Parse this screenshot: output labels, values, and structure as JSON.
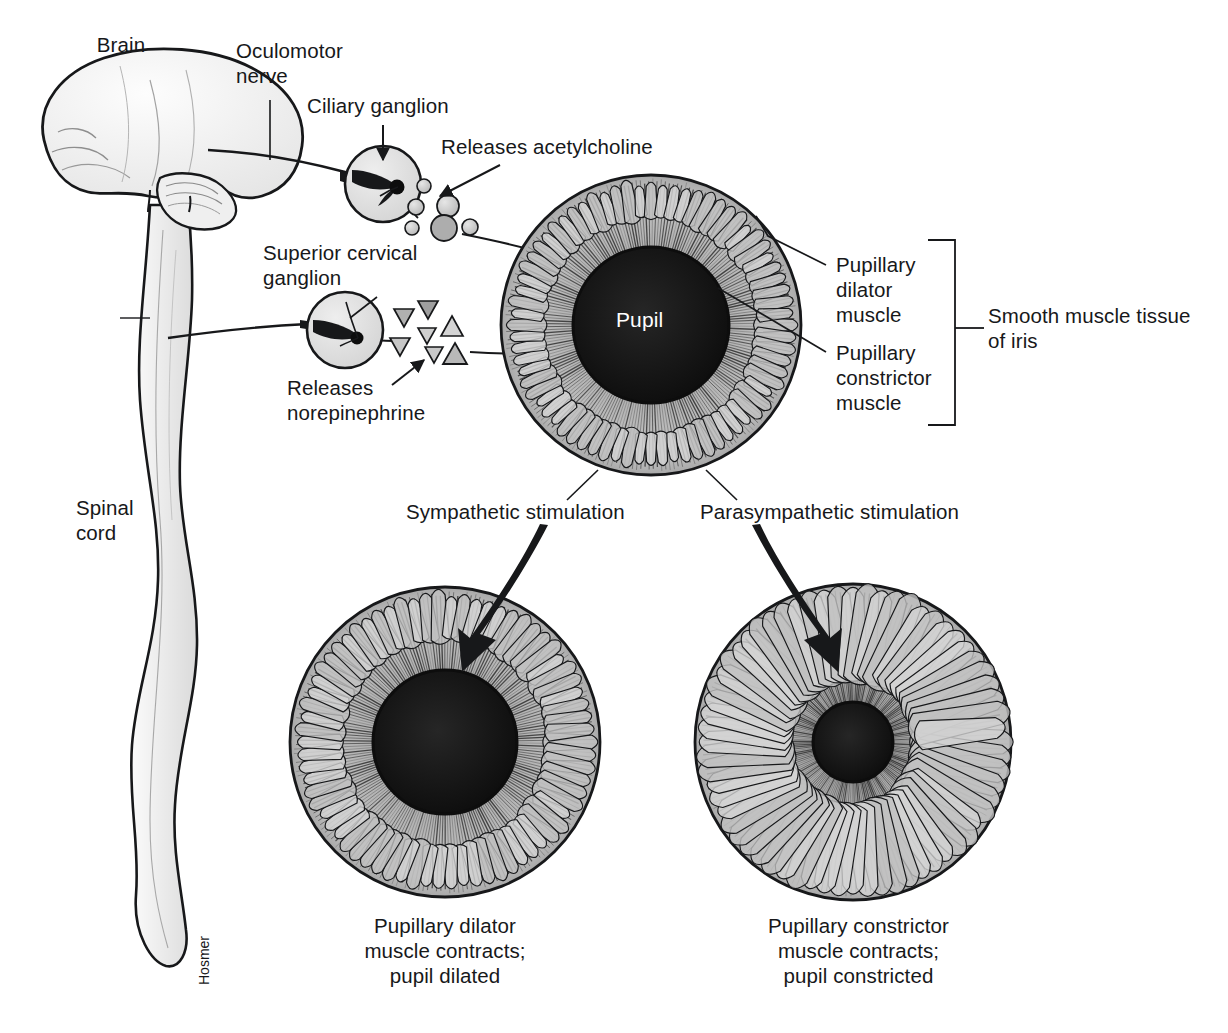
{
  "figure": {
    "artist_signature": "Hosmer",
    "background_color": "#ffffff",
    "ink_color": "#17181a",
    "tissue_fill": "#e9e9e9",
    "iris_fill": "#b9b9b9",
    "pupil_fill": "#141414"
  },
  "labels": {
    "brain": "Brain",
    "oculomotor_nerve": "Oculomotor\nnerve",
    "ciliary_ganglion": "Ciliary ganglion",
    "releases_acetylcholine": "Releases acetylcholine",
    "superior_cervical_ganglion": "Superior cervical\nganglion",
    "releases_norepinephrine": "Releases\nnorepinephrine",
    "spinal_cord": "Spinal\ncord",
    "pupil": "Pupil",
    "pupillary_dilator_muscle": "Pupillary\ndilator\nmuscle",
    "pupillary_constrictor_muscle": "Pupillary\nconstrictor\nmuscle",
    "smooth_muscle_tissue_of_iris": "Smooth muscle tissue\nof iris",
    "sympathetic_stimulation": "Sympathetic stimulation",
    "parasympathetic_stimulation": "Parasympathetic stimulation",
    "dilated_caption": "Pupillary dilator\nmuscle contracts;\npupil dilated",
    "constricted_caption": "Pupillary constrictor\nmuscle contracts;\npupil constricted"
  },
  "anatomy": {
    "ganglia": [
      {
        "name": "ciliary-ganglion",
        "cx": 383,
        "cy": 184,
        "r": 38
      },
      {
        "name": "superior-cervical-ganglion",
        "cx": 345,
        "cy": 330,
        "r": 38
      }
    ],
    "neurotransmitters": {
      "acetylcholine": {
        "shape": "circle",
        "particles": [
          {
            "cx": 424,
            "cy": 186,
            "r": 7
          },
          {
            "cx": 416,
            "cy": 207,
            "r": 8
          },
          {
            "cx": 412,
            "cy": 228,
            "r": 7
          },
          {
            "cx": 448,
            "cy": 206,
            "r": 11
          },
          {
            "cx": 444,
            "cy": 228,
            "r": 13
          },
          {
            "cx": 470,
            "cy": 227,
            "r": 8
          }
        ]
      },
      "norepinephrine": {
        "shape": "triangle",
        "particles": [
          {
            "cx": 404,
            "cy": 318,
            "r": 10,
            "dir": "down"
          },
          {
            "cx": 400,
            "cy": 347,
            "r": 10,
            "dir": "down"
          },
          {
            "cx": 428,
            "cy": 310,
            "r": 10,
            "dir": "down"
          },
          {
            "cx": 427,
            "cy": 336,
            "r": 9,
            "dir": "down"
          },
          {
            "cx": 434,
            "cy": 355,
            "r": 9,
            "dir": "down"
          },
          {
            "cx": 452,
            "cy": 327,
            "r": 11,
            "dir": "up"
          },
          {
            "cx": 455,
            "cy": 354,
            "r": 11,
            "dir": "up"
          }
        ]
      }
    },
    "irises": [
      {
        "name": "iris-main",
        "cx": 651,
        "cy": 325,
        "r": 150,
        "pupil_r": 78,
        "collarette_r": 104,
        "fold_count": 72,
        "state": "normal"
      },
      {
        "name": "iris-dilated",
        "cx": 445,
        "cy": 742,
        "r": 155,
        "pupil_r": 72,
        "collarette_r": 100,
        "fold_count": 70,
        "state": "dilated"
      },
      {
        "name": "iris-constricted",
        "cx": 853,
        "cy": 742,
        "r": 158,
        "pupil_r": 40,
        "collarette_r": 62,
        "fold_count": 64,
        "state": "constricted"
      }
    ],
    "bracket": {
      "x": 955,
      "y_top": 240,
      "y_bottom": 425,
      "tick_y": 328
    }
  }
}
